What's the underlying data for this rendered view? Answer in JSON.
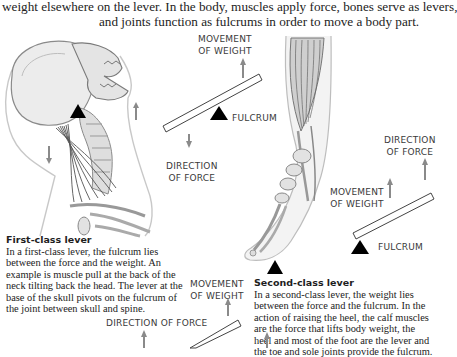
{
  "intro": {
    "line1": "weight elsewhere on the lever. In the body, muscles apply force, bones serve as levers,",
    "line2": "and joints function as fulcrums in order to move a body part."
  },
  "first_class": {
    "title": "First-class lever",
    "body": "In a first-class lever, the fulcrum lies between the force and the weight. An example is muscle pull at the back of the neck tilting back the head. The lever at the base of the skull pivots on the fulcrum of the joint between skull and spine.",
    "illustration": "skull-and-neck-illustration",
    "diagram": {
      "movement_of_weight": [
        "MOVEMENT",
        "OF WEIGHT"
      ],
      "fulcrum": "FULCRUM",
      "direction_of_force": [
        "DIRECTION",
        "OF FORCE"
      ]
    }
  },
  "second_class": {
    "title": "Second-class lever",
    "body": "In a second-class lever, the weight lies between the force and the fulcrum. In the action of raising the heel, the calf muscles are the force that lifts body weight, the heel and most of the foot are the lever and the toe and sole joints provide the fulcrum.",
    "illustration": "leg-and-foot-illustration",
    "diagram": {
      "direction_of_force": [
        "DIRECTION",
        "OF FORCE"
      ],
      "movement_of_weight": [
        "MOVEMENT",
        "OF WEIGHT"
      ],
      "fulcrum": "FULCRUM"
    }
  },
  "third_class_partial": {
    "movement_of_weight": [
      "MOVEMENT",
      "OF WEIGHT"
    ],
    "direction_of_force": "DIRECTION OF FORCE"
  },
  "colors": {
    "arrow": "#8a8a8a",
    "fulcrum": "#000000",
    "lever_outline": "#444444",
    "illustration_line": "#9a9a9a"
  }
}
